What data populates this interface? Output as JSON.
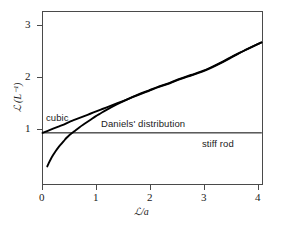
{
  "chart_data": {
    "type": "line",
    "title": "",
    "xlabel": "ℒ/a",
    "ylabel": "ℒ (L⁻¹)",
    "xlim": [
      0,
      4.15
    ],
    "ylim": [
      0,
      3.35
    ],
    "grid": false,
    "legend": "inline-annotations",
    "xticks": [
      0,
      1,
      2,
      3,
      4
    ],
    "xtick_labels": [
      "0",
      "1",
      "2",
      "3",
      "4"
    ],
    "yticks": [
      1,
      2,
      3
    ],
    "ytick_labels": [
      "1",
      "2",
      "3"
    ],
    "series": [
      {
        "name": "cubic",
        "label": "cubic",
        "color": "#000000",
        "x": [
          0.0,
          0.1,
          0.2,
          0.3,
          0.4,
          0.5,
          0.6,
          0.7,
          0.8,
          0.9,
          1.0,
          1.1,
          1.2,
          1.4,
          1.6,
          1.8,
          2.0,
          2.2,
          2.4,
          2.6,
          2.8,
          3.0,
          3.2,
          3.4,
          3.6,
          3.8,
          4.0,
          4.13
        ],
        "y": [
          1.0,
          1.04,
          1.08,
          1.12,
          1.16,
          1.21,
          1.25,
          1.29,
          1.33,
          1.37,
          1.41,
          1.45,
          1.49,
          1.57,
          1.65,
          1.73,
          1.81,
          1.89,
          1.96,
          2.04,
          2.11,
          2.18,
          2.27,
          2.37,
          2.48,
          2.59,
          2.69,
          2.75
        ]
      },
      {
        "name": "daniels-distribution",
        "label": "Daniels' distribution",
        "color": "#000000",
        "x": [
          0.09,
          0.12,
          0.16,
          0.2,
          0.25,
          0.3,
          0.35,
          0.4,
          0.45,
          0.5,
          0.55,
          0.6,
          0.7,
          0.8,
          0.9,
          1.0,
          1.1,
          1.2,
          1.4,
          1.6,
          1.8,
          2.0,
          2.2,
          2.4,
          2.6,
          2.8,
          3.0,
          3.2,
          3.4,
          3.6,
          3.8,
          4.0,
          4.13
        ],
        "y": [
          0.35,
          0.42,
          0.5,
          0.57,
          0.65,
          0.72,
          0.78,
          0.84,
          0.9,
          0.95,
          0.99,
          1.03,
          1.11,
          1.18,
          1.25,
          1.32,
          1.38,
          1.44,
          1.55,
          1.65,
          1.74,
          1.82,
          1.9,
          1.97,
          2.05,
          2.12,
          2.19,
          2.28,
          2.38,
          2.49,
          2.59,
          2.69,
          2.75
        ]
      },
      {
        "name": "stiff-rod",
        "label": "stiff rod",
        "color": "#000000",
        "x": [
          0.0,
          4.13
        ],
        "y": [
          1.0,
          1.0
        ]
      }
    ],
    "annotations": [
      {
        "name": "cubic-annotation",
        "text": "cubic"
      },
      {
        "name": "daniels-annotation",
        "text": "Daniels' distribution"
      },
      {
        "name": "stiff-rod-annotation",
        "text": "stiff rod"
      }
    ]
  },
  "axes": {
    "x_title": "ℒ/a",
    "y_title": "ℒ (L⁻¹)",
    "x_ticks": [
      {
        "value": 0,
        "label": "0"
      },
      {
        "value": 1,
        "label": "1"
      },
      {
        "value": 2,
        "label": "2"
      },
      {
        "value": 3,
        "label": "3"
      },
      {
        "value": 4,
        "label": "4"
      }
    ],
    "y_ticks": [
      {
        "value": 1,
        "label": "1"
      },
      {
        "value": 2,
        "label": "2"
      },
      {
        "value": 3,
        "label": "3"
      }
    ]
  },
  "labels": {
    "cubic": "cubic",
    "daniels": "Daniels' distribution",
    "stiff_rod": "stiff rod"
  },
  "colors": {
    "background": "#ffffff",
    "frame": "#4a4a4a",
    "curve": "#000000",
    "thin_line": "#555555",
    "text": "#1a1a1a"
  }
}
